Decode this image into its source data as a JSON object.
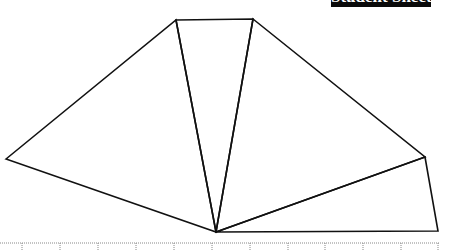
{
  "header": {
    "banner_text": "Student Sheet 10",
    "banner_color": "#0a0a0a"
  },
  "figure": {
    "stroke_color": "#111111",
    "vertices": {
      "left": [
        6,
        159
      ],
      "top_left": [
        176,
        20
      ],
      "top_right": [
        253,
        19
      ],
      "right": [
        425,
        157
      ],
      "bottom_right": [
        438,
        231
      ],
      "center_bottom": [
        216,
        232
      ]
    }
  },
  "ruler": {
    "line_y": 243,
    "tick_xs": [
      22,
      60,
      98,
      136,
      174,
      212,
      250,
      288,
      325,
      363,
      401,
      438
    ]
  }
}
